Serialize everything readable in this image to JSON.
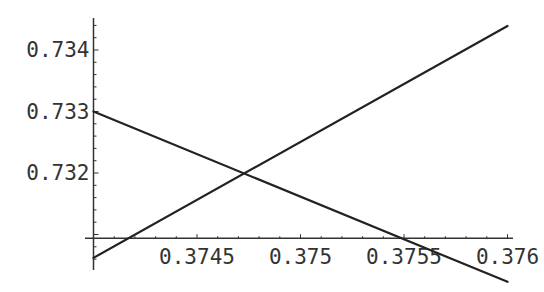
{
  "chart_data": {
    "type": "line",
    "title": "",
    "xlabel": "",
    "ylabel": "",
    "xlim": [
      0.374,
      0.376
    ],
    "ylim": [
      0.7301,
      0.7345
    ],
    "axes_origin": {
      "x": 0.374,
      "y": 0.73094
    },
    "grid": false,
    "legend": null,
    "x_ticks": [
      0.3745,
      0.375,
      0.3755,
      0.376
    ],
    "x_tick_labels": [
      "0.3745",
      "0.375",
      "0.3755",
      "0.376"
    ],
    "y_ticks": [
      0.732,
      0.733,
      0.734
    ],
    "y_tick_labels": [
      "0.732",
      "0.733",
      "0.734"
    ],
    "series": [
      {
        "name": "rising",
        "color": "#222222",
        "x": [
          0.374,
          0.376
        ],
        "y": [
          0.73062,
          0.73439
        ]
      },
      {
        "name": "falling",
        "color": "#222222",
        "x": [
          0.374,
          0.376
        ],
        "y": [
          0.733,
          0.73023
        ]
      }
    ],
    "intersection": {
      "x": 0.3747,
      "y": 0.73204
    }
  },
  "style": {
    "line_color": "#222222",
    "axis_color": "#333333"
  }
}
